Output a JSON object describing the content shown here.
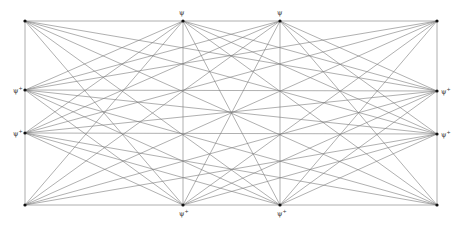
{
  "diagram": {
    "type": "line-intersection construction",
    "frame": {
      "left": 25,
      "right": 437,
      "top": 21,
      "bottom": 205
    },
    "line_color": "#7a7a7a",
    "point_color": "#111111",
    "points": [
      {
        "id": "TL",
        "x": 25,
        "y": 21,
        "side": "corner"
      },
      {
        "id": "T1",
        "x": 183,
        "y": 21,
        "side": "top"
      },
      {
        "id": "T2",
        "x": 280,
        "y": 21,
        "side": "top"
      },
      {
        "id": "TR",
        "x": 437,
        "y": 21,
        "side": "corner"
      },
      {
        "id": "L1",
        "x": 25,
        "y": 90,
        "side": "left"
      },
      {
        "id": "L2",
        "x": 25,
        "y": 133,
        "side": "left"
      },
      {
        "id": "R1",
        "x": 437,
        "y": 91,
        "side": "right"
      },
      {
        "id": "R2",
        "x": 437,
        "y": 134,
        "side": "right"
      },
      {
        "id": "BL",
        "x": 25,
        "y": 205,
        "side": "corner"
      },
      {
        "id": "B1",
        "x": 183,
        "y": 205,
        "side": "bottom"
      },
      {
        "id": "B2",
        "x": 280,
        "y": 205,
        "side": "bottom"
      },
      {
        "id": "BR",
        "x": 437,
        "y": 205,
        "side": "corner"
      }
    ],
    "labels": [
      {
        "text": "ψ",
        "sup": "",
        "x": 179,
        "y": 10
      },
      {
        "text": "ψ",
        "sup": "",
        "x": 277,
        "y": 10
      },
      {
        "text": "ψ",
        "sup": "+",
        "x": 13,
        "y": 86
      },
      {
        "text": "ψ",
        "sup": "+",
        "x": 13,
        "y": 129
      },
      {
        "text": "ψ",
        "sup": "+",
        "x": 441,
        "y": 87
      },
      {
        "text": "ψ",
        "sup": "+",
        "x": 441,
        "y": 130
      },
      {
        "text": "ψ",
        "sup": "+",
        "x": 179,
        "y": 209
      },
      {
        "text": "ψ",
        "sup": "+",
        "x": 277,
        "y": 209
      }
    ]
  }
}
